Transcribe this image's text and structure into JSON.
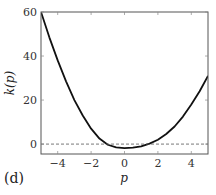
{
  "panel_label": "(d)",
  "chart_data": {
    "type": "line",
    "title": "",
    "xlabel": "p",
    "ylabel": "k(p)",
    "xlim": [
      -5,
      5
    ],
    "ylim": [
      -4.5,
      60
    ],
    "xticks": [
      -4,
      -2,
      0,
      2,
      4
    ],
    "yticks": [
      0,
      20,
      40,
      60
    ],
    "grid": false,
    "legend": null,
    "series": [
      {
        "name": "k(p)",
        "color": "#111111",
        "style": "solid",
        "x": [
          -5,
          -4.5,
          -4,
          -3.5,
          -3,
          -2.5,
          -2,
          -1.5,
          -1,
          -0.5,
          0,
          0.5,
          1,
          1.5,
          2,
          2.5,
          3,
          3.5,
          4,
          4.5,
          5
        ],
        "y": [
          60,
          48.5,
          38,
          28.5,
          20,
          13,
          7,
          2.5,
          -0.3,
          -1.5,
          -1.8,
          -1.6,
          -1.0,
          0.2,
          2,
          4.6,
          8,
          12.5,
          18,
          24,
          31
        ]
      },
      {
        "name": "zero reference",
        "color": "#555555",
        "style": "dashed",
        "x": [
          -5,
          5
        ],
        "y": [
          0,
          0
        ]
      }
    ]
  }
}
